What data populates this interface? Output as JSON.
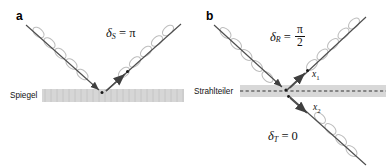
{
  "figure": {
    "type": "optics-phase-shift-diagram",
    "background": "#ffffff",
    "ray_color": "#4d4d4d",
    "coil_color": "#b9b9b9",
    "surface_fill": "#d5d5d5",
    "dash_color": "#3a3a3a"
  },
  "panel_a": {
    "label": "a",
    "surface_label": "Spiegel",
    "formula": {
      "symbol": "δ",
      "subscript": "S",
      "equals": "=",
      "value": "π"
    },
    "rays": [
      {
        "name": "incident-ray",
        "direction": "down-right"
      },
      {
        "name": "reflected-ray",
        "direction": "up-right"
      }
    ]
  },
  "panel_b": {
    "label": "b",
    "surface_label": "Strahlteiler",
    "formula_reflected": {
      "symbol": "δ",
      "subscript": "R",
      "equals": "=",
      "numerator": "π",
      "denominator": "2"
    },
    "formula_transmitted": {
      "symbol": "δ",
      "subscript": "T",
      "equals": "=",
      "value": "0"
    },
    "point_labels": [
      {
        "name": "point-x1",
        "text": "x",
        "sub": "1"
      },
      {
        "name": "point-x2",
        "text": "x",
        "sub": "2"
      }
    ],
    "rays": [
      {
        "name": "incident-ray",
        "direction": "down-right"
      },
      {
        "name": "reflected-ray",
        "direction": "up-right"
      },
      {
        "name": "transmitted-ray",
        "direction": "down-right"
      }
    ]
  }
}
